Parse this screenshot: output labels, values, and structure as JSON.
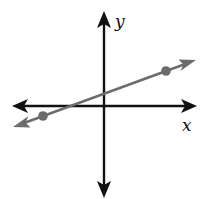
{
  "diagram": {
    "type": "coordinate-plane-line",
    "axes": {
      "x_label": "x",
      "y_label": "y",
      "color": "#111111"
    },
    "line": {
      "color": "#6b6b6b",
      "slope_sign": "positive",
      "description": "line through two points with arrows on both ends"
    },
    "points": [
      {
        "label": "",
        "position": "lower-left, quadrant III"
      },
      {
        "label": "",
        "position": "upper-right, quadrant I"
      }
    ],
    "point_color": "#6b6b6b"
  }
}
